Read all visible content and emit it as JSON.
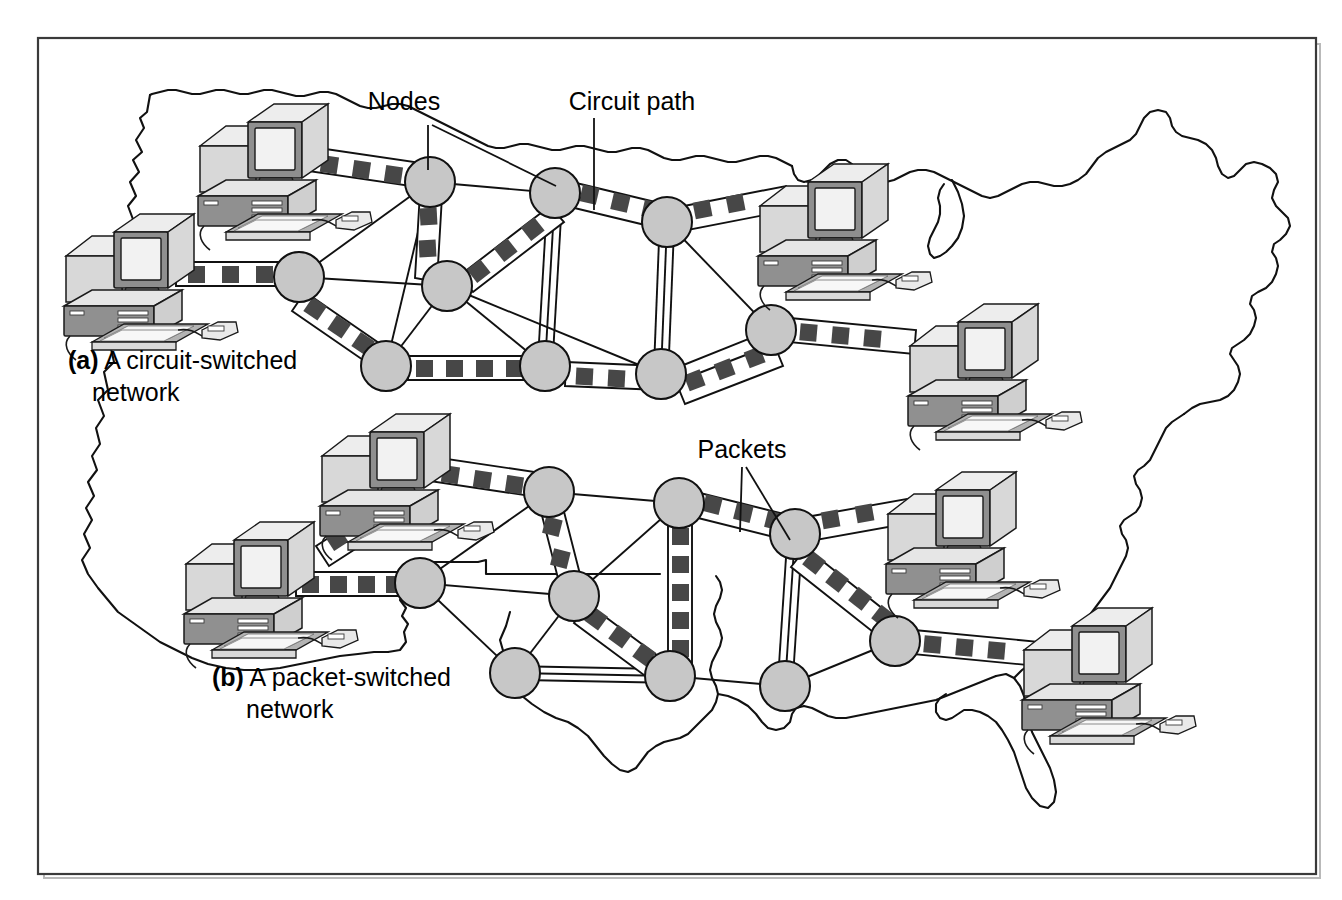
{
  "figure": {
    "background_color": "#ffffff",
    "frame_color": "#3a3a3a",
    "node_color": "#c7c7c7",
    "packet_color": "#474747",
    "line_color": "#111111"
  },
  "annotations": {
    "nodes_label": "Nodes",
    "circuit_path_label": "Circuit path",
    "packets_label": "Packets"
  },
  "captions": {
    "a": {
      "marker": "(a)",
      "line1": " A circuit-switched",
      "line2": "network"
    },
    "b": {
      "marker": "(b)",
      "line1": " A packet-switched",
      "line2": "network"
    }
  },
  "diagram_data": {
    "type": "diagram",
    "panels": [
      {
        "id": "a",
        "name": "circuit-switched-network",
        "caption": "(a) A circuit-switched network",
        "node_count": 9,
        "workstation_count": 4,
        "annotation_labels": [
          "Nodes",
          "Circuit path"
        ],
        "nodes": [
          {
            "id": "a1",
            "x": 430,
            "y": 182,
            "r": 25
          },
          {
            "id": "a2",
            "x": 299,
            "y": 277,
            "r": 25
          },
          {
            "id": "a3",
            "x": 555,
            "y": 193,
            "r": 25
          },
          {
            "id": "a4",
            "x": 447,
            "y": 286,
            "r": 25
          },
          {
            "id": "a5",
            "x": 667,
            "y": 222,
            "r": 25
          },
          {
            "id": "a6",
            "x": 386,
            "y": 366,
            "r": 25
          },
          {
            "id": "a7",
            "x": 545,
            "y": 366,
            "r": 25
          },
          {
            "id": "a8",
            "x": 661,
            "y": 374,
            "r": 25
          },
          {
            "id": "a9",
            "x": 771,
            "y": 330,
            "r": 25
          }
        ],
        "workstations": [
          {
            "id": "wa1",
            "x": 238,
            "y": 165,
            "scale": 1.0
          },
          {
            "id": "wa2",
            "x": 128,
            "y": 272,
            "scale": 1.0
          },
          {
            "id": "wa3",
            "x": 822,
            "y": 222,
            "scale": 1.0
          },
          {
            "id": "wa4",
            "x": 955,
            "y": 355,
            "scale": 1.0
          }
        ],
        "packet_links": [
          {
            "from": "wa1",
            "to": "a1",
            "packets": 4
          },
          {
            "from": "wa2",
            "to": "a2",
            "packets": 3
          },
          {
            "from": "a1",
            "to": "a4",
            "packets": 2
          },
          {
            "from": "a2",
            "to": "a6",
            "packets": 3
          },
          {
            "from": "a4",
            "to": "a3",
            "packets": 3
          },
          {
            "from": "a3",
            "to": "a5",
            "packets": 3
          },
          {
            "from": "a5",
            "to": "wa3",
            "packets": 2
          },
          {
            "from": "a6",
            "to": "a7",
            "packets": 4
          },
          {
            "from": "a7",
            "to": "a8",
            "packets": 2
          },
          {
            "from": "a8",
            "to": "a9",
            "packets": 3
          },
          {
            "from": "a9",
            "to": "wa4",
            "packets": 3
          }
        ],
        "plain_links": [
          {
            "from": "a1",
            "to": "a2"
          },
          {
            "from": "a1",
            "to": "a3"
          },
          {
            "from": "a1",
            "to": "a6"
          },
          {
            "from": "a2",
            "to": "a4"
          },
          {
            "from": "a3",
            "to": "a7"
          },
          {
            "from": "a3",
            "to": "a5"
          },
          {
            "from": "a4",
            "to": "a6"
          },
          {
            "from": "a4",
            "to": "a7"
          },
          {
            "from": "a4",
            "to": "a8"
          },
          {
            "from": "a5",
            "to": "a8"
          },
          {
            "from": "a5",
            "to": "a9"
          },
          {
            "from": "a6",
            "to": "a7"
          },
          {
            "from": "a7",
            "to": "a8"
          },
          {
            "from": "a8",
            "to": "a9"
          }
        ]
      },
      {
        "id": "b",
        "name": "packet-switched-network",
        "caption": "(b) A packet-switched network",
        "node_count": 9,
        "workstation_count": 4,
        "annotation_labels": [
          "Packets"
        ],
        "nodes": [
          {
            "id": "b1",
            "x": 549,
            "y": 492,
            "r": 25
          },
          {
            "id": "b2",
            "x": 420,
            "y": 583,
            "r": 25
          },
          {
            "id": "b3",
            "x": 679,
            "y": 503,
            "r": 25
          },
          {
            "id": "b4",
            "x": 574,
            "y": 596,
            "r": 25
          },
          {
            "id": "b5",
            "x": 795,
            "y": 534,
            "r": 25
          },
          {
            "id": "b6",
            "x": 515,
            "y": 673,
            "r": 25
          },
          {
            "id": "b7",
            "x": 670,
            "y": 676,
            "r": 25
          },
          {
            "id": "b8",
            "x": 785,
            "y": 686,
            "r": 25
          },
          {
            "id": "b9",
            "x": 895,
            "y": 641,
            "r": 25
          }
        ],
        "workstations": [
          {
            "id": "wb1",
            "x": 360,
            "y": 476,
            "scale": 1.0
          },
          {
            "id": "wb2",
            "x": 248,
            "y": 580,
            "scale": 1.0
          },
          {
            "id": "wb3",
            "x": 950,
            "y": 530,
            "scale": 1.0
          },
          {
            "id": "wb4",
            "x": 1085,
            "y": 665,
            "scale": 1.0
          }
        ],
        "packet_links": [
          {
            "from": "wb1",
            "to": "b1",
            "packets": 4
          },
          {
            "from": "wb2",
            "to": "b2",
            "packets": 4
          },
          {
            "from": "b1",
            "to": "b4",
            "packets": 2
          },
          {
            "from": "b3",
            "to": "b5",
            "packets": 3
          },
          {
            "from": "b3",
            "to": "b7",
            "packets": 5
          },
          {
            "from": "b5",
            "to": "wb3",
            "packets": 2
          },
          {
            "from": "b5",
            "to": "b9",
            "packets": 4
          },
          {
            "from": "b4",
            "to": "b7",
            "packets": 3
          },
          {
            "from": "b9",
            "to": "wb4",
            "packets": 3
          }
        ],
        "plain_links": [
          {
            "from": "b1",
            "to": "b2"
          },
          {
            "from": "b1",
            "to": "b3"
          },
          {
            "from": "b1",
            "to": "b4"
          },
          {
            "from": "b2",
            "to": "b6"
          },
          {
            "from": "b3",
            "to": "b4"
          },
          {
            "from": "b3",
            "to": "b7"
          },
          {
            "from": "b4",
            "to": "b6"
          },
          {
            "from": "b4",
            "to": "b7"
          },
          {
            "from": "b5",
            "to": "b8"
          },
          {
            "from": "b5",
            "to": "b9"
          },
          {
            "from": "b6",
            "to": "b7"
          },
          {
            "from": "b7",
            "to": "b8"
          },
          {
            "from": "b8",
            "to": "b9"
          },
          {
            "from": "b2",
            "to": "b4"
          }
        ]
      }
    ]
  }
}
